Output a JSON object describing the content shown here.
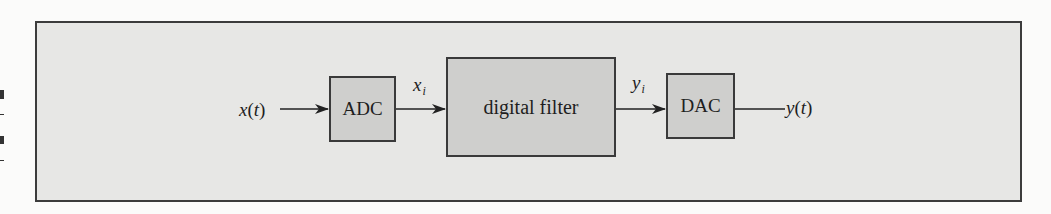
{
  "diagram": {
    "title": "",
    "colors": {
      "page_background": "#fbfbfa",
      "frame_background": "#e7e7e5",
      "frame_border": "#3c3c3c",
      "block_fill": "#cfcfcd",
      "block_border": "#3a3a3a",
      "wire": "#222222",
      "text": "#1e1e1e"
    },
    "input_signal": {
      "var": "x",
      "arg": "t",
      "open": "(",
      "close": ")"
    },
    "output_signal": {
      "var": "y",
      "arg": "t",
      "open": "(",
      "close": ")"
    },
    "blocks": [
      {
        "id": "adc",
        "label": "ADC"
      },
      {
        "id": "filter",
        "label": "digital filter"
      },
      {
        "id": "dac",
        "label": "DAC"
      }
    ],
    "edges": [
      {
        "from": "x(t)",
        "to": "ADC",
        "label": "",
        "arrow": true
      },
      {
        "from": "ADC",
        "to": "digital filter",
        "label_var": "x",
        "label_sub": "i",
        "arrow": true
      },
      {
        "from": "digital filter",
        "to": "DAC",
        "label_var": "y",
        "label_sub": "i",
        "arrow": true
      },
      {
        "from": "DAC",
        "to": "y(t)",
        "label": "",
        "arrow": false
      }
    ]
  }
}
